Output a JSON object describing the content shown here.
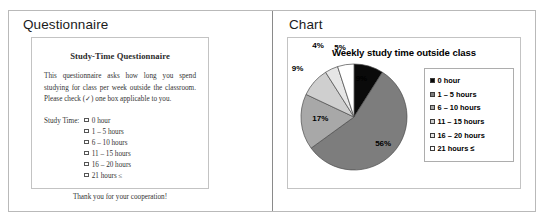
{
  "panes": {
    "left_title": "Questionnaire",
    "right_title": "Chart"
  },
  "questionnaire": {
    "heading": "Study-Time Questionnaire",
    "body": "This questionnaire asks how long you spend studying for class per week outside the classroom. Please check (✓) one box applicable to you.",
    "list_label": "Study Time:",
    "options": [
      "0 hour",
      "1 – 5 hours",
      "6 – 10 hours",
      "11 – 15 hours",
      "16 – 20 hours",
      "21 hours ≤"
    ],
    "thanks": "Thank you for your cooperation!"
  },
  "chart_data": {
    "type": "pie",
    "title": "Weekly study time outside class",
    "xlabel": "",
    "ylabel": "",
    "legend_position": "right",
    "start_angle_deg": 0,
    "direction": "clockwise",
    "categories": [
      "0 hour",
      "1 – 5 hours",
      "6 – 10 hours",
      "11 – 15 hours",
      "16 – 20 hours",
      "21 hours ≤"
    ],
    "values": [
      9,
      56,
      17,
      9,
      4,
      5
    ],
    "labels": [
      "9%",
      "56%",
      "17%",
      "9%",
      "4%",
      "5%"
    ],
    "colors": [
      "#0a0a0a",
      "#7d7d7d",
      "#a8a8a8",
      "#cfcfcf",
      "#e6e6e6",
      "#ffffff"
    ],
    "slice_border_color": "#4a4a4a"
  }
}
